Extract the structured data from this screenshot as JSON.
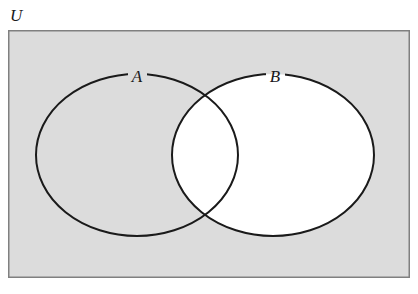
{
  "figure": {
    "type": "venn-diagram",
    "width": 418,
    "height": 294
  },
  "labels": {
    "universe": "U",
    "set_a": "A",
    "set_b": "B"
  },
  "colors": {
    "page_background": "#ffffff",
    "universe_fill": "#dcdcdc",
    "universe_border": "#808080",
    "circle_stroke": "#1a1a1a",
    "set_b_fill": "#ffffff",
    "label_color": "#1a1a1a"
  },
  "regions": {
    "universe_rect": {
      "x": 8,
      "y": 30,
      "width": 402,
      "height": 248,
      "fill": "#dcdcdc",
      "stroke": "#808080",
      "stroke_width": 1.5
    },
    "circle_a": {
      "cx": 137,
      "cy": 155,
      "rx": 101,
      "ry": 81,
      "fill": "none",
      "stroke": "#1a1a1a",
      "stroke_width": 2
    },
    "circle_b": {
      "cx": 273,
      "cy": 155,
      "rx": 101,
      "ry": 81,
      "fill": "#ffffff",
      "stroke": "#1a1a1a",
      "stroke_width": 2
    },
    "intersection_points": [
      {
        "x": 201,
        "y": 101
      },
      {
        "x": 201,
        "y": 212
      }
    ],
    "shaded_description": "Set B (entire disc including the intersection with A) is filled white; the remainder of the universal set, including the part of A outside B, is shaded gray."
  },
  "label_positions": {
    "universe": {
      "x": 10,
      "y": 21
    },
    "set_a": {
      "x": 137,
      "y": 82
    },
    "set_b": {
      "x": 275,
      "y": 82
    }
  }
}
